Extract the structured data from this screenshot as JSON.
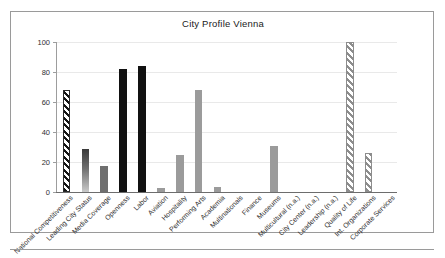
{
  "chart_data": {
    "type": "bar",
    "title": "City Profile Vienna",
    "xlabel": "",
    "ylabel": "",
    "ylim": [
      0,
      100
    ],
    "yticks": [
      0,
      20,
      40,
      60,
      80,
      100
    ],
    "grid": true,
    "legend": "none",
    "categories": [
      "National Competitiveness",
      "Leading City Status",
      "Media Coverage",
      "Openness",
      "Labor",
      "Aviation",
      "Hospitality",
      "Performing Arts",
      "Academia",
      "Multinationals",
      "Finance",
      "Museums",
      "Multicultural (n.a.)",
      "City Center (n.a.)",
      "Leadership (n.a.)",
      "Quality of Life",
      "Int. Organizations",
      "Corporate Services"
    ],
    "values": [
      68,
      29,
      17.5,
      82,
      84,
      2.5,
      25,
      68,
      3.5,
      0,
      0,
      31,
      0,
      0,
      0,
      100,
      26,
      0
    ],
    "styles": [
      "hatch-black",
      "grad-dark-light",
      "gray-dark",
      "solid-black",
      "solid-black",
      "gray-mid",
      "gray-mid",
      "gray-mid",
      "gray-mid",
      "zero",
      "zero",
      "gray-mid",
      "zero",
      "zero",
      "zero",
      "hatch-gray",
      "hatch-gray",
      "zero"
    ]
  },
  "colors": {
    "frame": "#9a9a9a",
    "axis": "#6d6d6d",
    "grid": "#e9e9e9",
    "bar_black": "#111111",
    "bar_gray": "#9b9b9b",
    "bar_gray_dark": "#6f6f6f",
    "text": "#2d2d2d",
    "background": "#ffffff"
  }
}
